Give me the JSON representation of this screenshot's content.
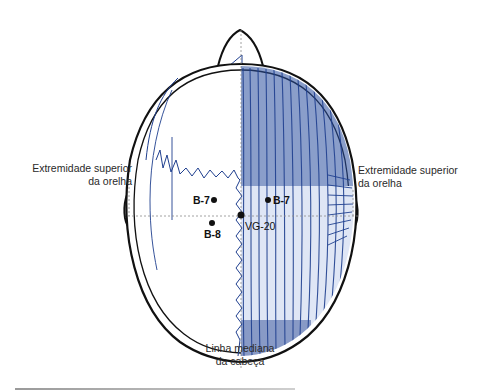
{
  "figure": {
    "colors": {
      "outline": "#111111",
      "muscle": "#1f3f8f",
      "guide_line": "#8a8a8a"
    },
    "labels": {
      "left_ear": {
        "line1": "Extremidade superior",
        "line2": "da orelha"
      },
      "right_ear": {
        "line1": "Extremidade superior",
        "line2": "da orelha"
      },
      "midline": {
        "line1": "Linha mediana",
        "line2": "da cabeça"
      }
    },
    "points": [
      {
        "id": "B-7",
        "label": "B-7",
        "side": "left"
      },
      {
        "id": "B-7",
        "label": "B-7",
        "side": "right"
      },
      {
        "id": "B-8",
        "label": "B-8",
        "side": "left"
      },
      {
        "id": "VG-20",
        "label": "VG-20",
        "side": "center"
      }
    ]
  }
}
